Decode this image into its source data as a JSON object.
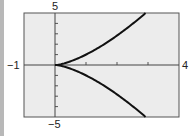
{
  "chart_data": {
    "type": "line",
    "title": "",
    "equation_hint": "y^2 = x^3 (y = ±x^(3/2))",
    "xlabel": "",
    "ylabel": "",
    "xlim": [
      -1,
      4
    ],
    "ylim": [
      -5,
      5
    ],
    "grid": false,
    "legend": null,
    "tick_labels": {
      "xmin": "−1",
      "xmax": "4",
      "ymax": "5",
      "ymin": "−5"
    },
    "x_ticks": [
      1,
      2,
      3
    ],
    "y_ticks": [
      -4,
      -3,
      -2,
      -1,
      1,
      2,
      3,
      4
    ],
    "series": [
      {
        "name": "upper branch",
        "x": [
          0,
          0.5,
          1,
          1.5,
          2,
          2.5,
          2.92
        ],
        "y": [
          0,
          0.35,
          1,
          1.84,
          2.83,
          3.95,
          5
        ]
      },
      {
        "name": "lower branch",
        "x": [
          0,
          0.5,
          1,
          1.5,
          2,
          2.5,
          2.92
        ],
        "y": [
          0,
          -0.35,
          -1,
          -1.84,
          -2.83,
          -3.95,
          -5
        ]
      }
    ],
    "colors": {
      "plot_bg": "#ececec",
      "frame": "#555555",
      "curve": "#111111"
    }
  }
}
